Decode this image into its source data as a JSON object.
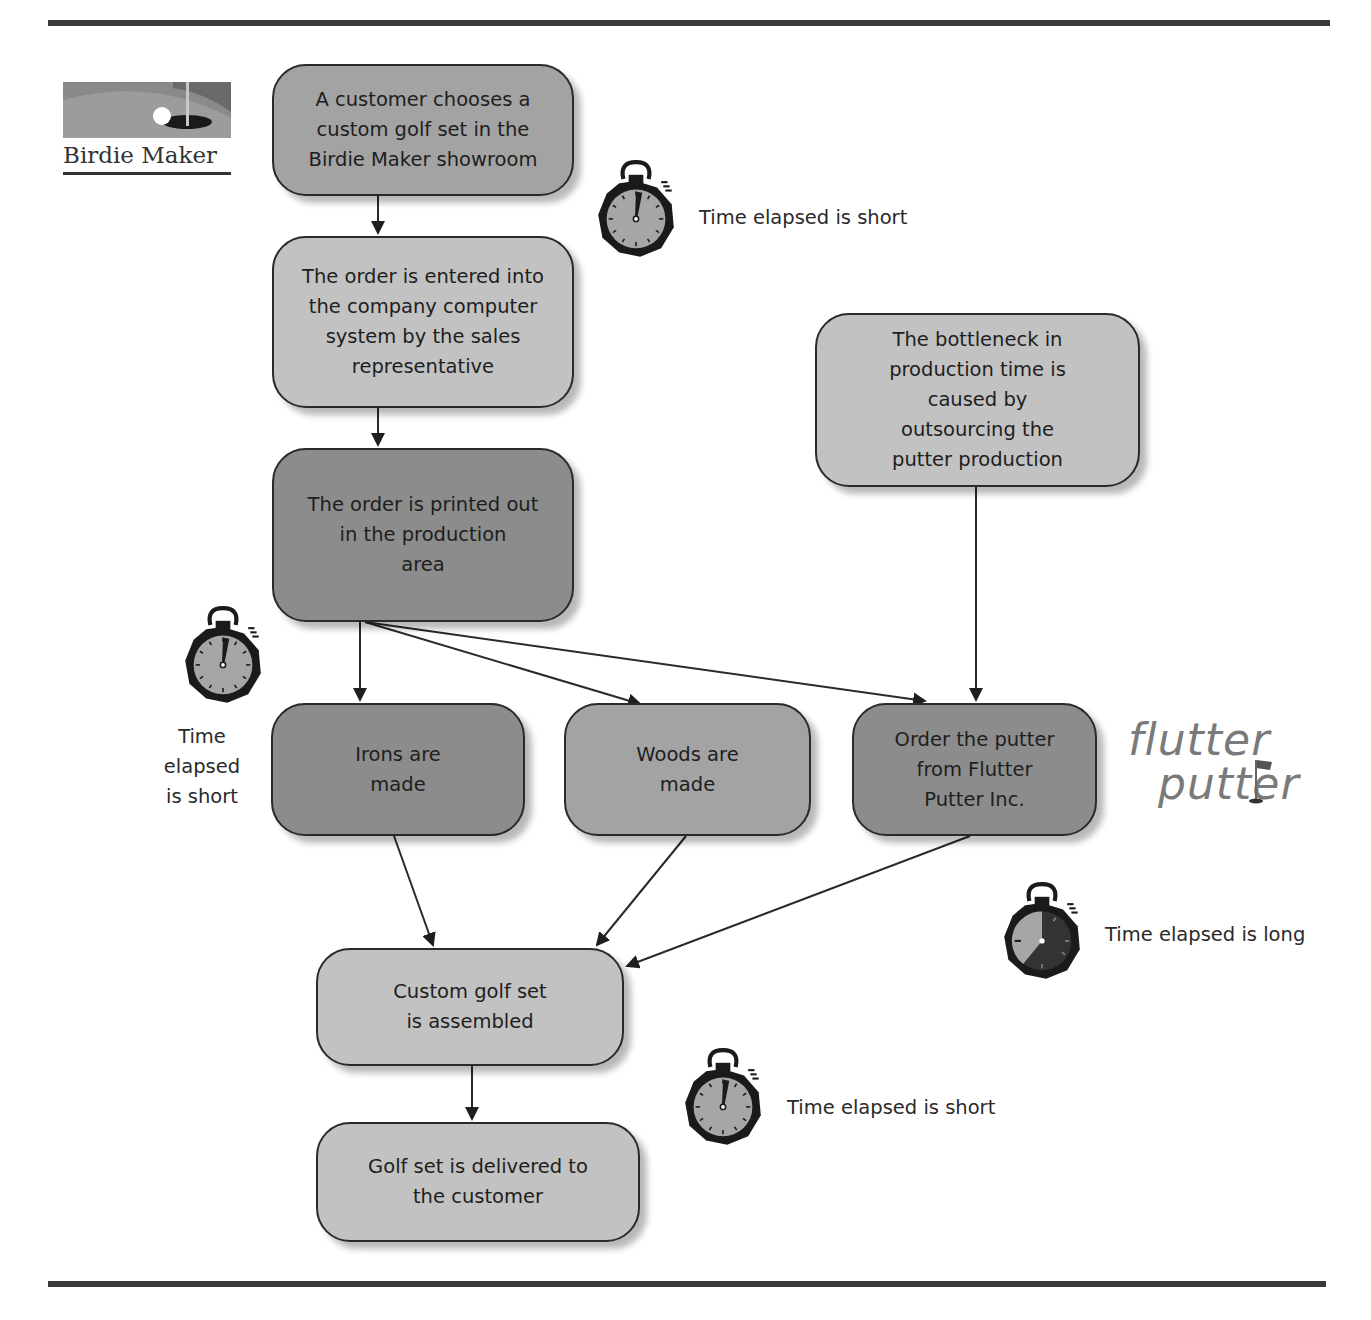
{
  "logos": {
    "birdie_maker": {
      "text": "Birdie Maker"
    },
    "flutter_putter": {
      "line1": "flutter",
      "line2": "putter"
    }
  },
  "boxes": [
    {
      "id": "choose",
      "text": "A customer chooses a\ncustom golf set in the\nBirdie Maker showroom",
      "shade": "mid"
    },
    {
      "id": "entered",
      "text": "The order is entered into\nthe company computer\nsystem by the sales\nrepresentative",
      "shade": "light"
    },
    {
      "id": "printed",
      "text": "The order is printed out\nin the production\narea",
      "shade": "dark"
    },
    {
      "id": "bottleneck",
      "text": "The bottleneck in\nproduction time is\ncaused by\noutsourcing the\nputter production",
      "shade": "light"
    },
    {
      "id": "irons",
      "text": "Irons are\nmade",
      "shade": "dark"
    },
    {
      "id": "woods",
      "text": "Woods are\nmade",
      "shade": "mid"
    },
    {
      "id": "putter",
      "text": "Order the putter\nfrom Flutter\nPutter Inc.",
      "shade": "dark"
    },
    {
      "id": "assembled",
      "text": "Custom golf set\nis assembled",
      "shade": "light"
    },
    {
      "id": "delivered",
      "text": "Golf set is delivered to\nthe customer",
      "shade": "light"
    }
  ],
  "timers": [
    {
      "id": "timer-1",
      "label": "Time elapsed is short",
      "duration": "short"
    },
    {
      "id": "timer-2",
      "label": "Time\nelapsed\nis short",
      "duration": "short"
    },
    {
      "id": "timer-3",
      "label": "Time elapsed is long",
      "duration": "long"
    },
    {
      "id": "timer-4",
      "label": "Time elapsed is short",
      "duration": "short"
    }
  ],
  "edges": [
    {
      "from": "choose",
      "to": "entered"
    },
    {
      "from": "entered",
      "to": "printed"
    },
    {
      "from": "printed",
      "to": "irons"
    },
    {
      "from": "printed",
      "to": "woods"
    },
    {
      "from": "printed",
      "to": "putter"
    },
    {
      "from": "bottleneck",
      "to": "putter"
    },
    {
      "from": "irons",
      "to": "assembled"
    },
    {
      "from": "woods",
      "to": "assembled"
    },
    {
      "from": "putter",
      "to": "assembled"
    },
    {
      "from": "assembled",
      "to": "delivered"
    }
  ],
  "colors": {
    "box_dark": "#8c8c8c",
    "box_mid": "#a3a3a3",
    "box_light": "#c2c2c2",
    "line": "#2a2a2a",
    "rule": "#3a3a3a"
  }
}
